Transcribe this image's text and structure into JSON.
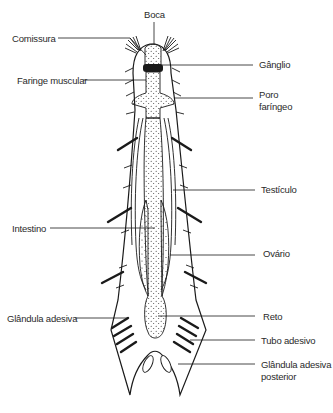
{
  "diagram": {
    "labels": {
      "boca": "Boca",
      "comissura": "Comissura",
      "ganglio": "Gânglio",
      "faringe_muscular": "Faringe muscular",
      "poro_faringeo_1": "Poro",
      "poro_faringeo_2": "faríngeo",
      "testiculo": "Testículo",
      "intestino": "Intestino",
      "ovario": "Ovário",
      "glandula_adesiva": "Glândula adesiva",
      "reto": "Reto",
      "tubo_adesivo": "Tubo adesivo",
      "glandula_adesiva_posterior_1": "Glândula adesiva",
      "glandula_adesiva_posterior_2": "posterior"
    },
    "colors": {
      "ink": "#1a1a1a",
      "background": "#ffffff",
      "text": "#2a2a2a"
    }
  }
}
